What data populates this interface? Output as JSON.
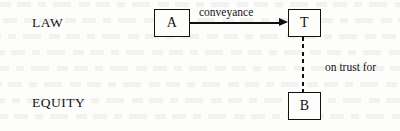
{
  "diagram": {
    "type": "legal-trust-relationship-diagram",
    "tiers": [
      {
        "id": "law",
        "label": "LAW"
      },
      {
        "id": "equity",
        "label": "EQUITY"
      }
    ],
    "nodes": [
      {
        "id": "a",
        "label": "A",
        "tier": "law"
      },
      {
        "id": "t",
        "label": "T",
        "tier": "law"
      },
      {
        "id": "b",
        "label": "B",
        "tier": "equity"
      }
    ],
    "edges": [
      {
        "id": "conveyance",
        "from": "a",
        "to": "t",
        "label": "conveyance",
        "style": "solid",
        "arrow": "single"
      },
      {
        "id": "on-trust-for",
        "from": "t",
        "to": "b",
        "label": "on trust for",
        "style": "dashed",
        "arrow": "none"
      }
    ],
    "colors": {
      "ink": "#111111",
      "paper": "#fdfdfb"
    }
  }
}
